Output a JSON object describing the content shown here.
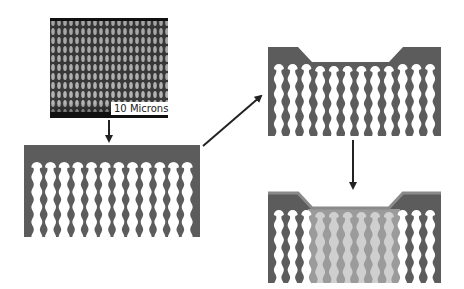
{
  "diagram": {
    "sem_image": {
      "scale_label": "10 Microns"
    },
    "colors": {
      "substrate": "#5c5c5c",
      "pore": "#ffffff",
      "fill": "#cfcfcf",
      "coating": "#8a8a8a",
      "arrow": "#222222",
      "sem_dark": "#2e2e2e",
      "sem_light": "#bdbdbd"
    },
    "panels": [
      {
        "id": "etched-pores",
        "channels": 12
      },
      {
        "id": "recessed-top",
        "channels": 12
      },
      {
        "id": "filled-recess",
        "channels": 12
      }
    ],
    "arrows": [
      {
        "id": "sem-to-etched",
        "direction": "down"
      },
      {
        "id": "etched-to-recessed",
        "direction": "up-right"
      },
      {
        "id": "recessed-to-filled",
        "direction": "down"
      }
    ]
  }
}
